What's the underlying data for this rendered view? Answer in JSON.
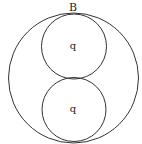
{
  "diagram": {
    "outer_label": "B",
    "inner_top_label": "q",
    "inner_bottom_label": "q",
    "stroke_color": "#333333",
    "background": "#ffffff"
  }
}
